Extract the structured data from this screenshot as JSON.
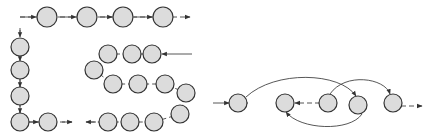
{
  "diagram": {
    "type": "node-flow",
    "node_style": {
      "fill": "#dcdcdc",
      "stroke": "#333333",
      "radius": 10
    },
    "line_color": "#555555",
    "panels": [
      {
        "name": "serpentine-path",
        "nodes": [
          {
            "x": 47,
            "y": 17
          },
          {
            "x": 87,
            "y": 17
          },
          {
            "x": 123,
            "y": 17
          },
          {
            "x": 163,
            "y": 17
          },
          {
            "x": 20,
            "y": 47
          },
          {
            "x": 20,
            "y": 70
          },
          {
            "x": 20,
            "y": 96
          },
          {
            "x": 20,
            "y": 122
          },
          {
            "x": 48,
            "y": 122
          },
          {
            "x": 108,
            "y": 54
          },
          {
            "x": 132,
            "y": 54
          },
          {
            "x": 152,
            "y": 54
          },
          {
            "x": 94,
            "y": 70
          },
          {
            "x": 113,
            "y": 84
          },
          {
            "x": 138,
            "y": 84
          },
          {
            "x": 165,
            "y": 84
          },
          {
            "x": 186,
            "y": 93
          },
          {
            "x": 180,
            "y": 114
          },
          {
            "x": 108,
            "y": 122
          },
          {
            "x": 130,
            "y": 122
          },
          {
            "x": 154,
            "y": 122
          }
        ]
      },
      {
        "name": "jump-path",
        "nodes": [
          {
            "x": 238,
            "y": 103
          },
          {
            "x": 285,
            "y": 103
          },
          {
            "x": 328,
            "y": 103
          },
          {
            "x": 358,
            "y": 105
          },
          {
            "x": 393,
            "y": 103
          }
        ]
      }
    ]
  }
}
